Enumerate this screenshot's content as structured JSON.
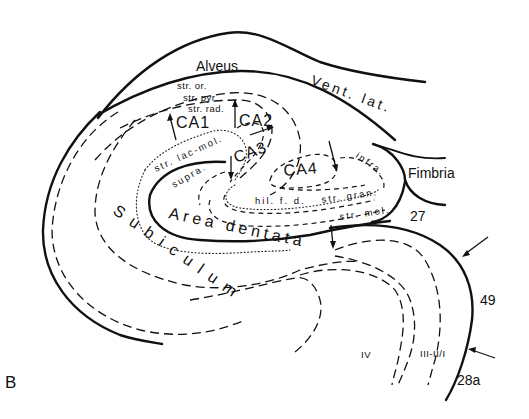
{
  "figure": {
    "panel_label": "B"
  },
  "labels": {
    "alveus": "Alveus",
    "vent_lat": "Vent. lat.",
    "str_or": "str. or.",
    "str_pyr": "str. pyr.",
    "str_rad": "str. rad.",
    "ca1": "CA1",
    "ca2": "CA2",
    "ca3": "CA3",
    "ca4": "CA4",
    "str_lac_mol": "str. lac-mol.",
    "supra": "supra.",
    "infra": "infra.",
    "fimbria": "Fimbria",
    "hil_fd": "hil. f. d.",
    "str_gran": "str. gran.",
    "str_mol": "str. mol.",
    "area_dentata": "Area dentata",
    "subiculum": "Subiculum",
    "area_27": "27",
    "area_49": "49",
    "area_28a": "28a",
    "layer_iv": "IV",
    "layer_iii_ii_i": "III-II/I"
  },
  "colors": {
    "ink": "#111111",
    "background": "#ffffff"
  }
}
